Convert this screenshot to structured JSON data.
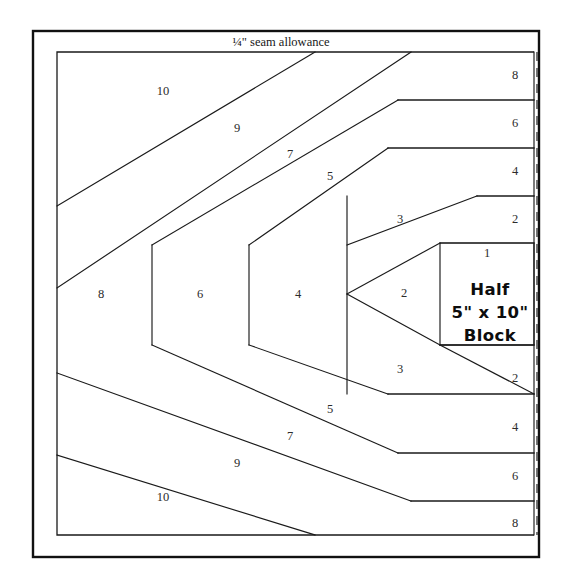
{
  "diagram": {
    "kind": "quilt-paper-piecing-pattern",
    "seam_allowance_label": "¼\" seam allowance",
    "block_label": {
      "line1": "Half",
      "line2": "5\" x 10\"",
      "line3": "Block"
    },
    "colors": {
      "background": "#ffffff",
      "outer_frame": "#111111",
      "piece_line": "#1a1a1a",
      "cut_line": "#4a4a4a",
      "number_text": "#2b2b2b",
      "block_text": "#0d0d0d"
    },
    "frames": {
      "outer": {
        "x": 33,
        "y": 31,
        "width": 506,
        "height": 526
      },
      "inner": {
        "x": 57,
        "y": 52,
        "width": 477,
        "height": 483
      },
      "cut_line_x": 537,
      "cut_line_y1": 52,
      "cut_line_y2": 535
    },
    "piece_numbers": {
      "upper_diagonals": [
        {
          "label": "10",
          "x": 163,
          "y": 92
        },
        {
          "label": "9",
          "x": 237,
          "y": 129
        },
        {
          "label": "7",
          "x": 290,
          "y": 155
        },
        {
          "label": "5",
          "x": 330,
          "y": 177
        },
        {
          "label": "3",
          "x": 400,
          "y": 220
        },
        {
          "label": "1",
          "x": 487,
          "y": 254
        }
      ],
      "right_strips_upper": [
        {
          "label": "8",
          "x": 515,
          "y": 76
        },
        {
          "label": "6",
          "x": 515,
          "y": 124
        },
        {
          "label": "4",
          "x": 515,
          "y": 172
        },
        {
          "label": "2",
          "x": 515,
          "y": 220
        }
      ],
      "right_strips_lower": [
        {
          "label": "2",
          "x": 515,
          "y": 379
        },
        {
          "label": "4",
          "x": 515,
          "y": 428
        },
        {
          "label": "6",
          "x": 515,
          "y": 477
        },
        {
          "label": "8",
          "x": 515,
          "y": 524
        }
      ],
      "center_band": [
        {
          "label": "8",
          "x": 101,
          "y": 295
        },
        {
          "label": "6",
          "x": 200,
          "y": 295
        },
        {
          "label": "4",
          "x": 298,
          "y": 295
        },
        {
          "label": "2",
          "x": 404,
          "y": 294
        }
      ],
      "lower_diagonals": [
        {
          "label": "3",
          "x": 400,
          "y": 370
        },
        {
          "label": "5",
          "x": 330,
          "y": 410
        },
        {
          "label": "7",
          "x": 290,
          "y": 437
        },
        {
          "label": "9",
          "x": 237,
          "y": 464
        },
        {
          "label": "10",
          "x": 163,
          "y": 498
        }
      ]
    },
    "geometry": {
      "left": 57,
      "right": 534,
      "top": 52,
      "bottom": 535,
      "mid_y": 294,
      "right_rule_ys_upper": [
        100,
        148,
        196,
        243
      ],
      "right_rule_ys_lower": [
        357,
        405,
        453,
        501
      ],
      "verticals_x": [
        152,
        249,
        347
      ],
      "diagonal_start_xs": [
        315,
        411,
        447,
        477
      ],
      "block_box": {
        "x": 440,
        "y": 243,
        "width": 94,
        "height": 102
      }
    }
  }
}
